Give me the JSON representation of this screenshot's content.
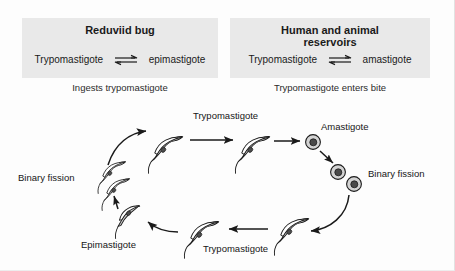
{
  "figure": {
    "background_color": "#fdfdfd",
    "band_color": "#e9e9e9",
    "ink_color": "#1a1a1a",
    "cell_fill_color": "#c9c9c9"
  },
  "header": {
    "left": {
      "title": "Reduviid bug",
      "equilibrium": {
        "left_term": "Trypomastigote",
        "arrow_symbol": "equilibrium-double-arrow",
        "right_term": "epimastigote"
      },
      "caption": "Ingests trypomastigote"
    },
    "right": {
      "title_line1": "Human and animal",
      "title_line2": "reservoirs",
      "equilibrium": {
        "left_term": "Trypomastigote",
        "arrow_symbol": "equilibrium-double-arrow",
        "right_term": "amastigote"
      },
      "caption": "Trypomastigote enters bite"
    }
  },
  "diagram": {
    "labels": {
      "trypomastigote_top": "Trypomastigote",
      "amastigote": "Amastigote",
      "binary_fission_right": "Binary fission",
      "trypomastigote_bottom": "Trypomastigote",
      "epimastigote": "Epimastigote",
      "binary_fission_left": "Binary fission"
    },
    "stages": [
      {
        "name": "trypomastigote-upper-left",
        "form": "trypomastigote",
        "x": 163,
        "y": 146
      },
      {
        "name": "trypomastigote-upper-right",
        "form": "trypomastigote",
        "x": 251,
        "y": 146
      },
      {
        "name": "amastigote-single",
        "form": "amastigote",
        "x": 312,
        "y": 143
      },
      {
        "name": "amastigote-dividing-upper",
        "form": "amastigote",
        "x": 338,
        "y": 173
      },
      {
        "name": "amastigote-dividing-lower",
        "form": "amastigote",
        "x": 353,
        "y": 184
      },
      {
        "name": "trypomastigote-lower-right",
        "form": "trypomastigote",
        "x": 289,
        "y": 227
      },
      {
        "name": "trypomastigote-lower-left",
        "form": "trypomastigote",
        "x": 199,
        "y": 230
      },
      {
        "name": "epimastigote",
        "form": "epimastigote",
        "x": 126,
        "y": 213
      },
      {
        "name": "binary-fission-pair-upper",
        "form": "trypomastigote",
        "x": 110,
        "y": 172
      },
      {
        "name": "binary-fission-pair-lower",
        "form": "trypomastigote",
        "x": 113,
        "y": 186
      }
    ],
    "arrows": [
      {
        "name": "arrow-fission-to-trypomastigote",
        "style": "curved"
      },
      {
        "name": "arrow-trypomastigote-to-trypomastigote",
        "style": "straight"
      },
      {
        "name": "arrow-trypomastigote-to-amastigote",
        "style": "straight"
      },
      {
        "name": "arrow-amastigote-to-fission",
        "style": "straight-diagonal"
      },
      {
        "name": "arrow-fission-to-trypomastigote-lower",
        "style": "curved"
      },
      {
        "name": "arrow-trypomastigote-to-trypomastigote-lower",
        "style": "straight"
      },
      {
        "name": "arrow-trypomastigote-to-epimastigote",
        "style": "curved"
      },
      {
        "name": "arrow-epimastigote-to-fission",
        "style": "straight-vertical"
      }
    ]
  }
}
